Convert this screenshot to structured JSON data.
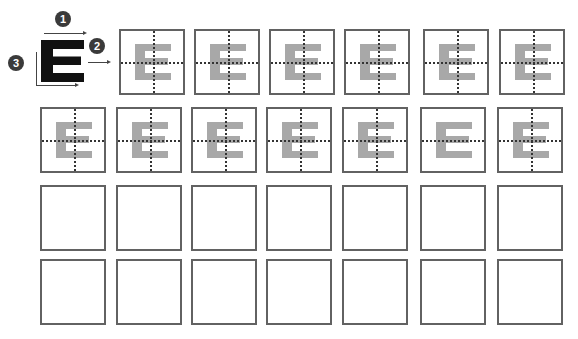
{
  "legend": {
    "letter": "E",
    "badges": [
      {
        "label": "1",
        "meaning": "horizontal-width-arrow"
      },
      {
        "label": "2",
        "meaning": "midline-arrow"
      },
      {
        "label": "3",
        "meaning": "vertical-height-arrow"
      }
    ]
  },
  "grid": {
    "rows": 4,
    "columns": 7,
    "colors": {
      "border": "#626262",
      "letter": "#a8a8a8",
      "guide": "#333333"
    },
    "cells": [
      [
        {
          "filled": true,
          "hline": true,
          "vline": true
        },
        {
          "filled": true,
          "hline": true,
          "vline": true
        },
        {
          "filled": true,
          "hline": true,
          "vline": true
        },
        {
          "filled": true,
          "hline": true,
          "vline": true
        },
        {
          "filled": true,
          "hline": true,
          "vline": true
        },
        {
          "filled": true,
          "hline": true,
          "vline": true
        }
      ],
      [
        {
          "filled": true,
          "hline": true,
          "vline": true
        },
        {
          "filled": true,
          "hline": true,
          "vline": true
        },
        {
          "filled": true,
          "hline": true,
          "vline": true
        },
        {
          "filled": true,
          "hline": true,
          "vline": true
        },
        {
          "filled": true,
          "hline": true,
          "vline": true
        },
        {
          "filled": true,
          "hline": true,
          "vline": false
        },
        {
          "filled": true,
          "hline": true,
          "vline": true
        }
      ],
      [
        {
          "filled": false
        },
        {
          "filled": false
        },
        {
          "filled": false
        },
        {
          "filled": false
        },
        {
          "filled": false
        },
        {
          "filled": false
        },
        {
          "filled": false
        }
      ],
      [
        {
          "filled": false
        },
        {
          "filled": false
        },
        {
          "filled": false
        },
        {
          "filled": false
        },
        {
          "filled": false
        },
        {
          "filled": false
        },
        {
          "filled": false
        }
      ]
    ]
  }
}
